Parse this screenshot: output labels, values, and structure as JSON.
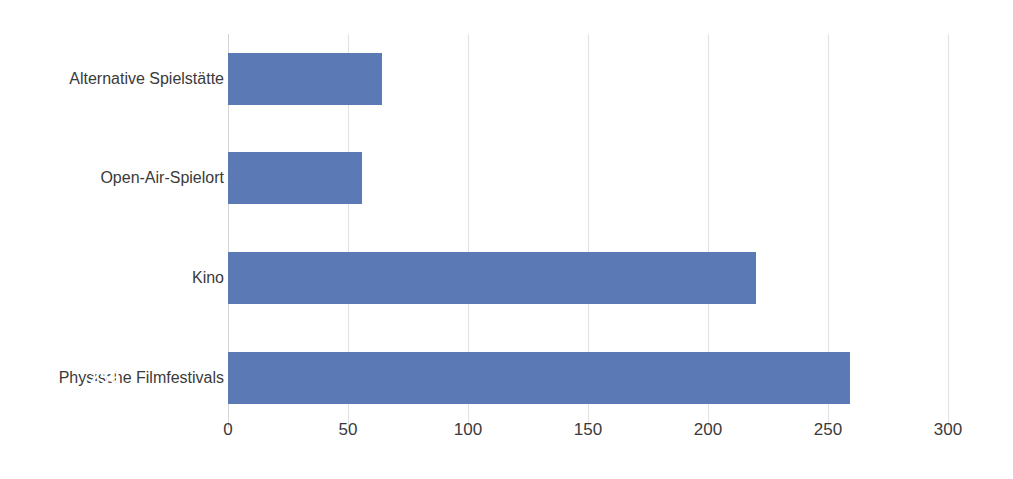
{
  "chart_data": {
    "type": "bar",
    "orientation": "horizontal",
    "title": "",
    "subtitle": "",
    "xlabel": "",
    "ylabel": "",
    "categories": [
      "Alternative Spielstätte",
      "Open-Air-Spielort",
      "Kino",
      "Physische Filmfestivals"
    ],
    "values": [
      64,
      56,
      220,
      259
    ],
    "value_labels": [
      "64",
      "56",
      "220",
      "259"
    ],
    "xlim": [
      0,
      300
    ],
    "xticks": [
      0,
      50,
      100,
      150,
      200,
      250,
      300
    ],
    "xtick_labels": [
      "0",
      "50",
      "100",
      "150",
      "200",
      "250",
      "300"
    ],
    "grid": true,
    "grid_axis": "x",
    "legend": false,
    "legend_position": "none",
    "series": [
      {
        "name": "",
        "values": [
          64,
          56,
          220,
          259
        ]
      }
    ]
  },
  "style": {
    "bar_color": "#5B79B5",
    "value_label_color": "#FFFFFF",
    "category_label_color": "#3A3A3A",
    "tick_label_color": "#3A3A3A",
    "gridline_color": "#E2E2E2",
    "axis_color": "#D5D5D5",
    "background": "#FFFFFF"
  }
}
